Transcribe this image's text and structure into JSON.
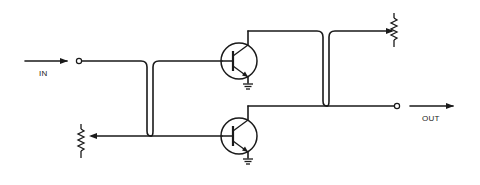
{
  "diagram": {
    "type": "circuit schematic",
    "labels": {
      "input": "IN",
      "output": "OUT"
    },
    "components": [
      {
        "id": "input-terminal",
        "kind": "terminal"
      },
      {
        "id": "output-terminal",
        "kind": "terminal"
      },
      {
        "id": "q1",
        "kind": "npn-transistor",
        "position": "top"
      },
      {
        "id": "q2",
        "kind": "npn-transistor",
        "position": "bottom"
      },
      {
        "id": "r1",
        "kind": "potentiometer",
        "position": "left"
      },
      {
        "id": "r2",
        "kind": "potentiometer",
        "position": "top-right"
      },
      {
        "id": "gnd1",
        "kind": "ground"
      },
      {
        "id": "gnd2",
        "kind": "ground"
      }
    ],
    "colors": {
      "line": "#1a1a1a",
      "background": "#ffffff"
    }
  }
}
